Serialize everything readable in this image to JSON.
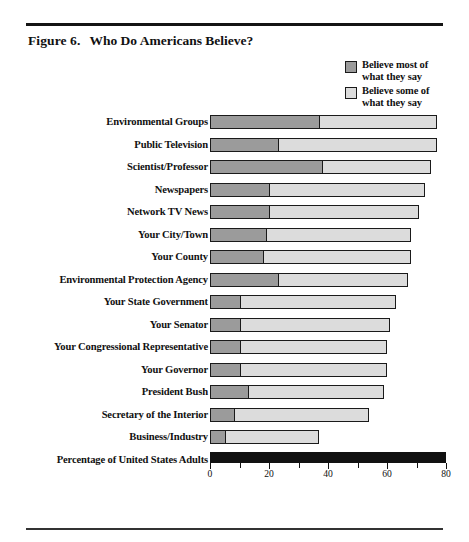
{
  "figure": {
    "number": "Figure 6.",
    "title": "Who Do Americans Believe?"
  },
  "legend": {
    "position": "top-right",
    "items": [
      {
        "label_line1": "Believe most of",
        "label_line2": "what they say",
        "swatch": "dark",
        "color": "#9b9b9b"
      },
      {
        "label_line1": "Believe some of",
        "label_line2": "what they say",
        "swatch": "light",
        "color": "#dcdcdc"
      }
    ]
  },
  "axis": {
    "label": "Percentage of United States Adults",
    "ticks_major": [
      0,
      20,
      40,
      60,
      80
    ],
    "ticks_minor": [
      10,
      30,
      50,
      70
    ],
    "tick_labels": [
      "0",
      "20",
      "40",
      "60",
      "80"
    ]
  },
  "colors": {
    "most": "#9b9b9b",
    "some": "#dcdcdc",
    "outline": "#1a1a1a",
    "axis_bar": "#111111",
    "rule": "#141414"
  },
  "chart_data": {
    "type": "bar",
    "orientation": "horizontal",
    "stacked": true,
    "title": "Who Do Americans Believe?",
    "xlabel": "Percentage of United States Adults",
    "ylabel": "",
    "xlim": [
      0,
      80
    ],
    "grid": false,
    "legend_position": "top-right",
    "categories": [
      "Environmental Groups",
      "Public Television",
      "Scientist/Professor",
      "Newspapers",
      "Network TV News",
      "Your City/Town",
      "Your County",
      "Environmental Protection Agency",
      "Your State Government",
      "Your Senator",
      "Your Congressional Representative",
      "Your Governor",
      "President Bush",
      "Secretary of the Interior",
      "Business/Industry"
    ],
    "series": [
      {
        "name": "Believe most of what they say",
        "values": [
          37,
          23,
          38,
          20,
          20,
          19,
          18,
          23,
          10,
          10,
          10,
          10,
          13,
          8,
          5
        ]
      },
      {
        "name": "Believe some of what they say",
        "values": [
          40,
          54,
          37,
          53,
          51,
          49,
          50,
          44,
          53,
          51,
          50,
          50,
          46,
          46,
          32
        ]
      }
    ],
    "totals": [
      77,
      77,
      75,
      73,
      71,
      68,
      68,
      67,
      63,
      61,
      60,
      60,
      59,
      54,
      37
    ]
  }
}
